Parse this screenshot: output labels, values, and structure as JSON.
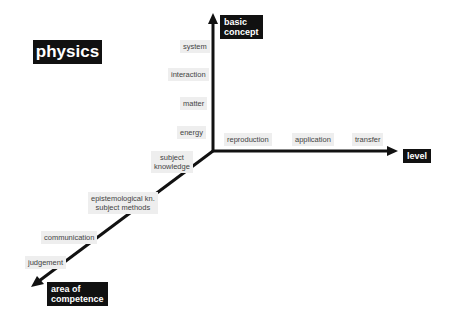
{
  "title": "physics",
  "axes": {
    "vertical": {
      "label_line1": "basic",
      "label_line2": "concept",
      "ticks": [
        "system",
        "interaction",
        "matter",
        "energy"
      ]
    },
    "horizontal": {
      "label": "level",
      "ticks": [
        "reproduction",
        "application",
        "transfer"
      ]
    },
    "diagonal": {
      "label_line1": "area of",
      "label_line2": "competence",
      "ticks": [
        {
          "line1": "subject",
          "line2": "knowledge"
        },
        {
          "line1": "epistemological kn.",
          "line2": "subject methods"
        },
        {
          "line1": "communication"
        },
        {
          "line1": "judgement"
        }
      ]
    }
  },
  "colors": {
    "axis": "#111111",
    "tick_bg": "#eeeeee",
    "label_bg": "#111111"
  }
}
